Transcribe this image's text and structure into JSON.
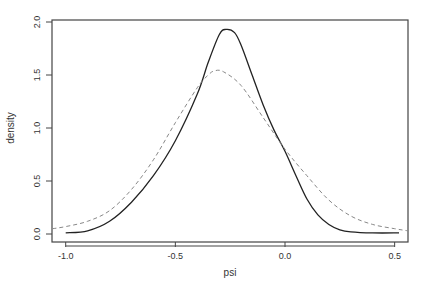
{
  "chart_data": {
    "type": "line",
    "title": "",
    "xlabel": "psi",
    "ylabel": "density",
    "xlim": [
      -1.06,
      0.56
    ],
    "ylim": [
      -0.05,
      2.05
    ],
    "x_ticks": [
      -1.0,
      -0.5,
      0.0,
      0.5
    ],
    "x_tick_labels": [
      "-1.0",
      "-0.5",
      "0.0",
      "0.5"
    ],
    "y_ticks": [
      0.0,
      0.5,
      1.0,
      1.5,
      2.0
    ],
    "y_tick_labels": [
      "0.0",
      "0.5",
      "1.0",
      "1.5",
      "2.0"
    ],
    "grid": false,
    "legend": null,
    "series": [
      {
        "name": "solid",
        "style": "solid",
        "color": "#222222",
        "points": [
          [
            -1.0,
            0.01
          ],
          [
            -0.9,
            0.03
          ],
          [
            -0.8,
            0.12
          ],
          [
            -0.7,
            0.3
          ],
          [
            -0.6,
            0.55
          ],
          [
            -0.5,
            0.88
          ],
          [
            -0.4,
            1.32
          ],
          [
            -0.35,
            1.62
          ],
          [
            -0.3,
            1.88
          ],
          [
            -0.27,
            1.93
          ],
          [
            -0.23,
            1.9
          ],
          [
            -0.2,
            1.78
          ],
          [
            -0.15,
            1.5
          ],
          [
            -0.1,
            1.22
          ],
          [
            -0.05,
            0.98
          ],
          [
            0.0,
            0.78
          ],
          [
            0.05,
            0.55
          ],
          [
            0.1,
            0.33
          ],
          [
            0.15,
            0.18
          ],
          [
            0.2,
            0.09
          ],
          [
            0.25,
            0.04
          ],
          [
            0.3,
            0.02
          ],
          [
            0.4,
            0.01
          ],
          [
            0.52,
            0.01
          ]
        ]
      },
      {
        "name": "dashed",
        "style": "dashed",
        "color": "#888888",
        "points": [
          [
            -1.06,
            0.05
          ],
          [
            -1.0,
            0.07
          ],
          [
            -0.9,
            0.12
          ],
          [
            -0.8,
            0.22
          ],
          [
            -0.7,
            0.42
          ],
          [
            -0.6,
            0.7
          ],
          [
            -0.5,
            1.05
          ],
          [
            -0.4,
            1.38
          ],
          [
            -0.35,
            1.5
          ],
          [
            -0.32,
            1.54
          ],
          [
            -0.28,
            1.53
          ],
          [
            -0.2,
            1.4
          ],
          [
            -0.1,
            1.1
          ],
          [
            0.0,
            0.8
          ],
          [
            0.1,
            0.55
          ],
          [
            0.2,
            0.32
          ],
          [
            0.3,
            0.17
          ],
          [
            0.4,
            0.09
          ],
          [
            0.5,
            0.05
          ],
          [
            0.56,
            0.03
          ]
        ]
      }
    ]
  }
}
